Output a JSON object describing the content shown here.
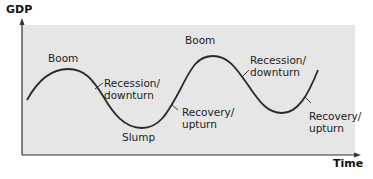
{
  "axes": {
    "y_label": "GDP",
    "x_label": "Time"
  },
  "labels": {
    "boom_1": "Boom",
    "recession_1_line1": "Recession/",
    "recession_1_line2": "downturn",
    "slump": "Slump",
    "recovery_1_line1": "Recovery/",
    "recovery_1_line2": "upturn",
    "boom_2": "Boom",
    "recession_2_line1": "Recession/",
    "recession_2_line2": "downturn",
    "recovery_2_line1": "Recovery/",
    "recovery_2_line2": "upturn"
  },
  "colors": {
    "background_panel": "#e6e6e6",
    "curve": "#2a2a2a",
    "text": "#222222"
  }
}
